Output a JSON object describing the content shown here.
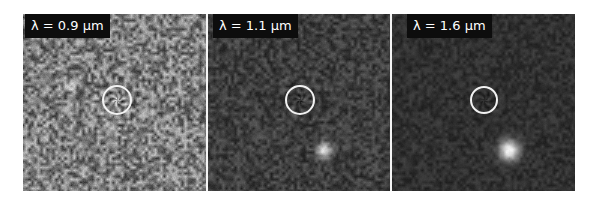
{
  "figure": {
    "panels": [
      {
        "label": "λ = 0.9 µm",
        "wavelength_um": 0.9,
        "background_level": 125,
        "noise_amplitude": 70,
        "ring": {
          "cx": 94,
          "cy": 86,
          "r": 15
        },
        "sources": [
          {
            "x": 48,
            "y": 72,
            "r": 3,
            "brightness": 60
          },
          {
            "x": 118,
            "y": 137,
            "r": 3,
            "brightness": 60
          }
        ]
      },
      {
        "label": "λ = 1.1 µm",
        "wavelength_um": 1.1,
        "background_level": 62,
        "noise_amplitude": 30,
        "ring": {
          "cx": 92,
          "cy": 86,
          "r": 15
        },
        "sources": [
          {
            "x": 116,
            "y": 136,
            "r": 5,
            "brightness": 160
          }
        ]
      },
      {
        "label": "λ = 1.6 µm",
        "wavelength_um": 1.6,
        "background_level": 48,
        "noise_amplitude": 18,
        "ring": {
          "cx": 92,
          "cy": 86,
          "r": 14
        },
        "sources": [
          {
            "x": 117,
            "y": 136,
            "r": 7,
            "brightness": 200
          }
        ]
      }
    ]
  },
  "colors": {
    "label_bg": "#0d0d0d",
    "label_text": "#ffffff",
    "ring": "#f2f2f2",
    "divider": "#f4f4f4"
  }
}
